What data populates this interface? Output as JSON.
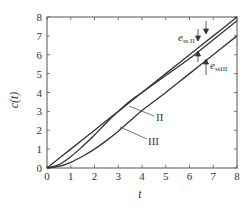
{
  "chart_data": {
    "type": "line",
    "title": "",
    "xlabel": "t",
    "ylabel": "c(t)",
    "xlim": [
      0,
      8
    ],
    "ylim": [
      0,
      8
    ],
    "grid": false,
    "legend": "none (inline curve labels)",
    "x_ticks": [
      "0",
      "1",
      "2",
      "3",
      "4",
      "5",
      "6",
      "7",
      "8"
    ],
    "y_ticks": [
      "0",
      "1",
      "2",
      "3",
      "4",
      "5",
      "6",
      "7",
      "8"
    ],
    "series": [
      {
        "name": "r(t) = t (ramp input)",
        "x": [
          0,
          1,
          2,
          3,
          4,
          5,
          6,
          7,
          8
        ],
        "values": [
          0,
          1,
          2,
          3,
          4,
          5,
          6,
          7,
          8
        ]
      },
      {
        "name": "II",
        "x": [
          0,
          0.5,
          1,
          1.5,
          2,
          2.5,
          3,
          3.5,
          4,
          5,
          6,
          7,
          8
        ],
        "values": [
          0,
          0.18,
          0.6,
          1.15,
          1.75,
          2.4,
          3.0,
          3.55,
          4.0,
          4.9,
          5.8,
          6.8,
          7.8
        ]
      },
      {
        "name": "III",
        "x": [
          0,
          0.5,
          1,
          1.5,
          2,
          2.5,
          3,
          3.5,
          4,
          5,
          6,
          7,
          8
        ],
        "values": [
          0,
          0.08,
          0.3,
          0.62,
          1.0,
          1.45,
          1.95,
          2.5,
          3.05,
          4.0,
          5.0,
          6.0,
          7.0
        ]
      }
    ],
    "annotations": [
      {
        "text_main": "e",
        "text_sub": "ss II",
        "meaning": "steady-state error of type II system (gap between r(t) and curve II)",
        "at_t": 6.5
      },
      {
        "text_main": "e",
        "text_sub": "ssIII",
        "meaning": "steady-state error of type III system (gap between curve II and III)",
        "at_t": 6.8
      },
      {
        "text": "II",
        "label_for": "curve II"
      },
      {
        "text": "III",
        "label_for": "curve III"
      }
    ]
  },
  "labels": {
    "xlabel": "t",
    "ylabel": "c(t)",
    "curve_II": "II",
    "curve_III": "III",
    "ess2_main": "e",
    "ess2_sub": "ss II",
    "ess3_main": "e",
    "ess3_sub": "ssIII"
  },
  "colors": {
    "line": "#333333",
    "axis": "#555555",
    "background": "#ffffff"
  }
}
